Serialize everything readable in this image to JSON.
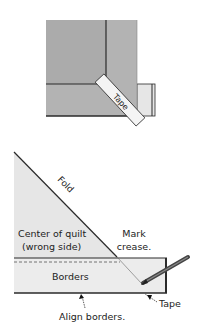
{
  "top_diagram": {
    "tape_label": "Tape",
    "colors": {
      "quilt_dark": "#a9a9a9",
      "quilt_mid": "#b4b4b4",
      "border_light": "#e4e4e4",
      "line": "#2a2a2a",
      "tape_fill": "#f4f4f4"
    }
  },
  "bottom_diagram": {
    "fold_label": "Fold",
    "center_label_line1": "Center of quilt",
    "center_label_line2": "(wrong side)",
    "mark_label_line1": "Mark",
    "mark_label_line2": "crease.",
    "borders_label": "Borders",
    "align_label": "Align borders.",
    "tape_label": "Tape",
    "colors": {
      "triangle_fill": "#e6e6e6",
      "strip_fill": "#ececec",
      "line": "#2a2a2a",
      "pencil": "#555555"
    }
  }
}
